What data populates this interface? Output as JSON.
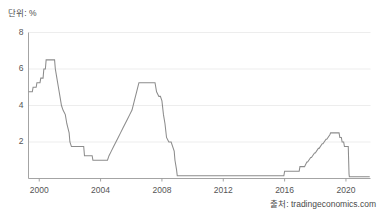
{
  "unit_label": "단위: %",
  "source_label": "출처: tradingeconomics.com",
  "chart_data": {
    "type": "line",
    "title": "",
    "subtitle": "",
    "xlabel": "",
    "ylabel": "단위: %",
    "legend": [],
    "legend_position": "none",
    "grid": true,
    "xlim": [
      1999.3,
      2021.6
    ],
    "ylim": [
      0,
      8
    ],
    "y_ticks": [
      2,
      4,
      6,
      8
    ],
    "y_tick_labels": [
      "2",
      "4",
      "6",
      "8"
    ],
    "x_ticks": [
      2000,
      2004,
      2008,
      2012,
      2016,
      2020
    ],
    "x_tick_labels": [
      "2000",
      "2004",
      "2008",
      "2012",
      "2016",
      "2020"
    ],
    "line_color": "#8c8c8c",
    "grid_color": "#e9e9e9",
    "axis_color": "#9a9a9a",
    "series": [
      {
        "name": "Interest Rate",
        "x": [
          1999.3,
          1999.55,
          1999.6,
          1999.8,
          1999.85,
          2000.05,
          2000.1,
          2000.25,
          2000.3,
          2000.4,
          2000.45,
          2001.0,
          2001.05,
          2001.15,
          2001.25,
          2001.35,
          2001.45,
          2001.55,
          2001.7,
          2001.8,
          2001.95,
          2002.0,
          2002.1,
          2002.9,
          2002.95,
          2003.1,
          2003.15,
          2003.45,
          2003.5,
          2004.0,
          2004.05,
          2004.45,
          2004.55,
          2004.7,
          2004.85,
          2005.0,
          2005.15,
          2005.3,
          2005.45,
          2005.6,
          2005.75,
          2005.9,
          2006.05,
          2006.2,
          2006.35,
          2006.5,
          2007.55,
          2007.65,
          2007.8,
          2007.9,
          2008.0,
          2008.1,
          2008.2,
          2008.3,
          2008.45,
          2008.6,
          2008.8,
          2008.85,
          2008.95,
          2009.0,
          2015.95,
          2016.0,
          2016.95,
          2017.0,
          2017.25,
          2017.3,
          2017.45,
          2017.5,
          2017.7,
          2017.75,
          2017.95,
          2018.0,
          2018.2,
          2018.25,
          2018.45,
          2018.5,
          2018.7,
          2018.75,
          2018.95,
          2019.0,
          2019.55,
          2019.6,
          2019.7,
          2019.75,
          2019.85,
          2019.9,
          2020.15,
          2020.2,
          2020.22,
          2021.55
        ],
        "y": [
          4.75,
          4.75,
          5.0,
          5.0,
          5.25,
          5.25,
          5.5,
          5.5,
          6.0,
          6.0,
          6.5,
          6.5,
          6.0,
          5.5,
          5.0,
          4.5,
          4.0,
          3.75,
          3.5,
          3.0,
          2.5,
          2.0,
          1.75,
          1.75,
          1.25,
          1.25,
          1.25,
          1.25,
          1.0,
          1.0,
          1.0,
          1.0,
          1.25,
          1.5,
          1.75,
          2.0,
          2.25,
          2.5,
          2.75,
          3.0,
          3.25,
          3.5,
          3.75,
          4.25,
          4.75,
          5.25,
          5.25,
          4.75,
          4.5,
          4.5,
          4.25,
          3.5,
          3.0,
          2.25,
          2.0,
          2.0,
          1.5,
          1.0,
          0.5,
          0.15,
          0.15,
          0.4,
          0.4,
          0.65,
          0.65,
          0.65,
          0.9,
          0.9,
          1.15,
          1.15,
          1.4,
          1.4,
          1.65,
          1.65,
          1.9,
          1.9,
          2.15,
          2.15,
          2.4,
          2.5,
          2.5,
          2.25,
          2.25,
          2.0,
          2.0,
          1.75,
          1.75,
          0.25,
          0.1,
          0.1
        ],
        "key_points": {
          "start_1999": 4.75,
          "peak_2000": 6.5,
          "trough_2003_2004": 1.0,
          "peak_2006_2007": 5.25,
          "floor_2009_2015": 0.15,
          "peak_2019": 2.5,
          "floor_2020_2021": 0.1
        }
      }
    ]
  }
}
